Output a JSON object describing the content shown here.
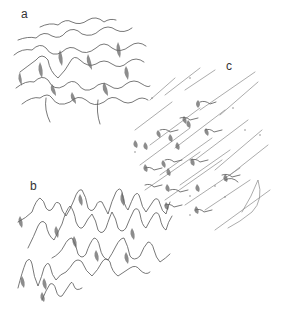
{
  "figure": {
    "panels": [
      {
        "label": "a",
        "description": "irregular overlapping wave crests with shaded troughs"
      },
      {
        "label": "b",
        "description": "tall peaked wave crests in rows"
      },
      {
        "label": "c",
        "description": "diagonal streaks with small shaded wave marks"
      }
    ],
    "stroke_color": "#555555",
    "background": "#ffffff"
  }
}
